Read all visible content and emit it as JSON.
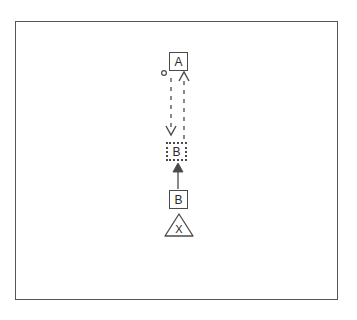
{
  "figure": {
    "background_color": "#ffffff",
    "frame": {
      "name": "diagram-border",
      "stroke_color": "#555555",
      "x": 15,
      "y": 21,
      "width": 323,
      "height": 279
    },
    "stroke_color": "#4a4a4a",
    "text_color": "#2b2b2b"
  },
  "nodes": [
    {
      "id": "node-a",
      "label": "A",
      "shape": "square",
      "border_style": "solid",
      "x": 169,
      "y": 52,
      "width": 19,
      "height": 19
    },
    {
      "id": "node-b-goal",
      "label": "B",
      "shape": "square",
      "border_style": "dotted",
      "x": 166,
      "y": 142,
      "width": 21,
      "height": 19
    },
    {
      "id": "node-b-current",
      "label": "B",
      "shape": "square",
      "border_style": "solid",
      "x": 169,
      "y": 190,
      "width": 19,
      "height": 19
    },
    {
      "id": "node-x-hazard",
      "label": "X",
      "shape": "triangle",
      "border_style": "solid",
      "x": 165,
      "y": 214,
      "width": 28,
      "height": 22
    }
  ],
  "markers": [
    {
      "id": "marker-origin-dot",
      "shape": "circle",
      "label": "",
      "cx": 164,
      "cy": 73,
      "r": 2.5,
      "filled": false
    }
  ],
  "edges": [
    {
      "id": "edge-a-down",
      "style": "dashed",
      "direction": "down",
      "x": 171,
      "y_start": 76,
      "y_end": 134,
      "arrowhead": "end"
    },
    {
      "id": "edge-b-up-dashed",
      "style": "dashed",
      "direction": "up",
      "x": 184,
      "y_start": 140,
      "y_end": 74,
      "arrowhead": "end"
    },
    {
      "id": "edge-b-up-solid",
      "style": "solid",
      "direction": "up",
      "x": 178,
      "y_start": 189,
      "y_end": 164,
      "arrowhead": "end"
    }
  ]
}
